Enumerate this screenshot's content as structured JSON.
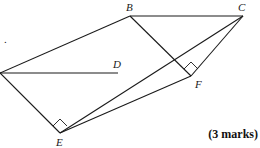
{
  "diagram": {
    "stray_text": ".",
    "vertices": {
      "A": {
        "x": 0,
        "y": 73,
        "label": ""
      },
      "B": {
        "x": 130,
        "y": 16,
        "label": "B"
      },
      "C": {
        "x": 243,
        "y": 16,
        "label": "C"
      },
      "D": {
        "x": 118,
        "y": 73,
        "label": "D"
      },
      "E": {
        "x": 60,
        "y": 133,
        "label": "E"
      },
      "F": {
        "x": 191,
        "y": 76,
        "label": "F"
      }
    },
    "edges": [
      [
        "A",
        "B"
      ],
      [
        "B",
        "C"
      ],
      [
        "A",
        "D"
      ],
      [
        "A",
        "E"
      ],
      [
        "E",
        "C"
      ],
      [
        "E",
        "F"
      ],
      [
        "B",
        "F"
      ],
      [
        "F",
        "C"
      ]
    ],
    "right_angles": [
      "E",
      "F"
    ]
  },
  "footer": {
    "marks_label": "(3 marks)"
  }
}
